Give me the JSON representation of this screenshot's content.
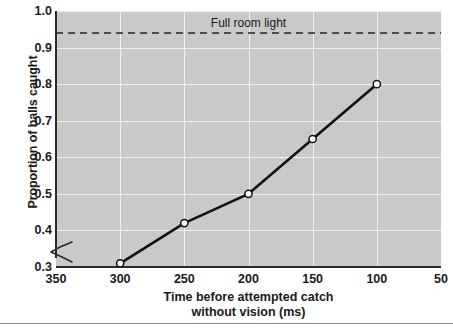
{
  "chart_data": {
    "type": "line",
    "title": "",
    "xlabel": "Time before attempted catch without vision (ms)",
    "xlabel_line1": "Time before attempted catch",
    "xlabel_line2": "without vision (ms)",
    "ylabel": "Proportion of balls caught",
    "x": [
      300,
      250,
      200,
      150,
      100
    ],
    "values": [
      0.31,
      0.42,
      0.5,
      0.65,
      0.8
    ],
    "series": [
      {
        "name": "Proportion of balls caught",
        "x": [
          300,
          250,
          200,
          150,
          100
        ],
        "values": [
          0.31,
          0.42,
          0.5,
          0.65,
          0.8
        ]
      }
    ],
    "xlim": [
      350,
      50
    ],
    "ylim": [
      0.3,
      1.0
    ],
    "x_ticks": [
      350,
      300,
      250,
      200,
      150,
      100,
      50
    ],
    "x_tick_labels": [
      "350",
      "300",
      "250",
      "200",
      "150",
      "100",
      "50"
    ],
    "y_ticks": [
      0.3,
      0.4,
      0.5,
      0.6,
      0.7,
      0.8,
      0.9,
      1.0
    ],
    "y_tick_labels": [
      "1.0",
      "0.9",
      "0.8",
      "0.7",
      "0.6",
      "0.5",
      "0.4",
      "0.3"
    ],
    "x_axis_inverted": true,
    "y_axis_break": true,
    "grid": true,
    "legend": "none",
    "annotations": [
      {
        "name": "full-room-light",
        "label": "Full room light",
        "type": "horizontal-reference-line",
        "y": 0.94,
        "linestyle": "dashed",
        "label_x": 200
      }
    ],
    "colors": {
      "plot_background": "#c9c9c9",
      "gridline": "#f0f0f0",
      "line": "#111111",
      "marker_face": "#ffffff",
      "marker_edge": "#111111",
      "axis": "#2b2b2b",
      "text": "#1a1a1a",
      "reference_line": "#222222",
      "bottom_rule": "#8c8c8c"
    },
    "marker": "circle-open"
  }
}
